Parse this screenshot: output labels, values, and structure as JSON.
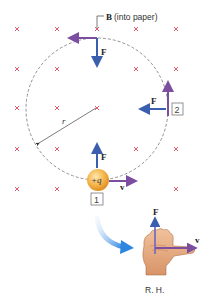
{
  "figure": {
    "field_label": "B",
    "field_note": "(into paper)",
    "force_label": "F",
    "velocity_label": "v",
    "radius_label": "r",
    "charge_label": "+q",
    "position_labels": [
      "1",
      "2"
    ],
    "hand_caption": "R. H.",
    "colors": {
      "field_marker": "#e05a6a",
      "force_arrow": "#3b5fae",
      "velocity_arrow": "#7b4ea0",
      "charge": "#f2a93b",
      "orbit": "#777777",
      "curved_arrow": "#3d8fe0",
      "hand": "#e8b088"
    }
  }
}
